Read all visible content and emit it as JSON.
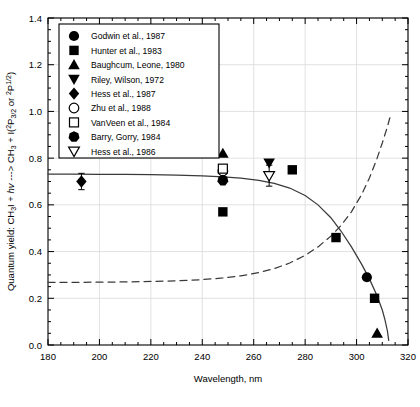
{
  "chart_data": {
    "type": "scatter",
    "title": "",
    "xlabel": "Wavelength, nm",
    "ylabel": "Quantum yield: CH3I + hv ---> CH3 + I(2P3/2 or 2P1/2)",
    "ylabel_parts": {
      "pre": "Quantum yield: CH",
      "sub1": "3",
      "mid1": "I + ",
      "italic1": "hv",
      "mid2": " ---> CH",
      "sub2": "3",
      "mid3": " + I(",
      "sup1": "2",
      "mid4": "P",
      "sub3": "3/2",
      "mid5": " or ",
      "sup2": "2",
      "mid6": "P",
      "sup3": "1/2",
      "post": ")"
    },
    "xlim": [
      180,
      320
    ],
    "ylim": [
      0.0,
      1.4
    ],
    "xticks": [
      180,
      200,
      220,
      240,
      260,
      280,
      300,
      320
    ],
    "yticks": [
      "0.0",
      "0.2",
      "0.4",
      "0.6",
      "0.8",
      "1.0",
      "1.2",
      "1.4"
    ],
    "ytick_values": [
      0.0,
      0.2,
      0.4,
      0.6,
      0.8,
      1.0,
      1.2,
      1.4
    ],
    "xminor_interval": 5,
    "yminor_interval": 0.05,
    "grid": true,
    "grid_color": "#d9d9d9",
    "legend_position": "upper-left",
    "series": [
      {
        "name": "Godwin et al., 1987",
        "marker": "filled-circle",
        "points": [
          {
            "x": 304,
            "y": 0.29
          }
        ]
      },
      {
        "name": "Hunter et al., 1983",
        "marker": "filled-square",
        "points": [
          {
            "x": 248,
            "y": 0.57
          },
          {
            "x": 275,
            "y": 0.75
          },
          {
            "x": 292,
            "y": 0.46
          },
          {
            "x": 307,
            "y": 0.2
          }
        ]
      },
      {
        "name": "Baughcum, Leone, 1980",
        "marker": "filled-up-triangle",
        "points": [
          {
            "x": 248,
            "y": 0.82
          },
          {
            "x": 308,
            "y": 0.05
          }
        ]
      },
      {
        "name": "Riley, Wilson, 1972",
        "marker": "filled-down-triangle",
        "points": [
          {
            "x": 266,
            "y": 0.78
          }
        ]
      },
      {
        "name": "Hess et al., 1987",
        "marker": "filled-diamond",
        "points": [
          {
            "x": 193,
            "y": 0.7,
            "yerr": 0.035
          }
        ]
      },
      {
        "name": "Zhu et al., 1988",
        "marker": "open-circle",
        "points": [
          {
            "x": 248,
            "y": 0.745
          }
        ]
      },
      {
        "name": "VanVeen et al., 1984",
        "marker": "open-square",
        "points": [
          {
            "x": 248,
            "y": 0.755
          }
        ]
      },
      {
        "name": "Barry, Gorry, 1984",
        "marker": "filled-heptagon",
        "points": [
          {
            "x": 248,
            "y": 0.705
          }
        ]
      },
      {
        "name": "Hess et al., 1986",
        "marker": "open-down-triangle",
        "points": [
          {
            "x": 266,
            "y": 0.725,
            "yerr": 0.045
          }
        ]
      }
    ],
    "curves": [
      {
        "name": "solid-curve",
        "style": "solid",
        "points": [
          {
            "x": 180,
            "y": 0.732
          },
          {
            "x": 190,
            "y": 0.732
          },
          {
            "x": 200,
            "y": 0.731
          },
          {
            "x": 210,
            "y": 0.73
          },
          {
            "x": 220,
            "y": 0.729
          },
          {
            "x": 230,
            "y": 0.727
          },
          {
            "x": 240,
            "y": 0.724
          },
          {
            "x": 248,
            "y": 0.72
          },
          {
            "x": 255,
            "y": 0.714
          },
          {
            "x": 262,
            "y": 0.705
          },
          {
            "x": 268,
            "y": 0.692
          },
          {
            "x": 274,
            "y": 0.672
          },
          {
            "x": 280,
            "y": 0.64
          },
          {
            "x": 285,
            "y": 0.6
          },
          {
            "x": 290,
            "y": 0.545
          },
          {
            "x": 294,
            "y": 0.487
          },
          {
            "x": 298,
            "y": 0.42
          },
          {
            "x": 302,
            "y": 0.345
          },
          {
            "x": 305,
            "y": 0.283
          },
          {
            "x": 308,
            "y": 0.21
          },
          {
            "x": 310,
            "y": 0.15
          },
          {
            "x": 311,
            "y": 0.11
          },
          {
            "x": 312,
            "y": 0.06
          },
          {
            "x": 312.5,
            "y": 0.02
          }
        ]
      },
      {
        "name": "dashed-curve",
        "style": "dashed",
        "points": [
          {
            "x": 180,
            "y": 0.268
          },
          {
            "x": 190,
            "y": 0.268
          },
          {
            "x": 200,
            "y": 0.269
          },
          {
            "x": 210,
            "y": 0.27
          },
          {
            "x": 220,
            "y": 0.272
          },
          {
            "x": 230,
            "y": 0.275
          },
          {
            "x": 240,
            "y": 0.28
          },
          {
            "x": 248,
            "y": 0.287
          },
          {
            "x": 255,
            "y": 0.296
          },
          {
            "x": 262,
            "y": 0.31
          },
          {
            "x": 268,
            "y": 0.327
          },
          {
            "x": 274,
            "y": 0.351
          },
          {
            "x": 280,
            "y": 0.384
          },
          {
            "x": 285,
            "y": 0.42
          },
          {
            "x": 290,
            "y": 0.466
          },
          {
            "x": 294,
            "y": 0.512
          },
          {
            "x": 298,
            "y": 0.57
          },
          {
            "x": 302,
            "y": 0.645
          },
          {
            "x": 305,
            "y": 0.715
          },
          {
            "x": 308,
            "y": 0.8
          },
          {
            "x": 310,
            "y": 0.865
          },
          {
            "x": 312,
            "y": 0.935
          },
          {
            "x": 313,
            "y": 0.975
          }
        ]
      }
    ]
  },
  "legend": {
    "entries": [
      {
        "label": "Godwin et al., 1987",
        "marker": "filled-circle"
      },
      {
        "label": "Hunter et al., 1983",
        "marker": "filled-square"
      },
      {
        "label": "Baughcum, Leone, 1980",
        "marker": "filled-up-triangle"
      },
      {
        "label": "Riley, Wilson, 1972",
        "marker": "filled-down-triangle"
      },
      {
        "label": "Hess et al., 1987",
        "marker": "filled-diamond"
      },
      {
        "label": "Zhu et al., 1988",
        "marker": "open-circle"
      },
      {
        "label": "VanVeen et al., 1984",
        "marker": "open-square"
      },
      {
        "label": "Barry, Gorry, 1984",
        "marker": "filled-heptagon"
      },
      {
        "label": "Hess et al., 1986",
        "marker": "open-down-triangle"
      }
    ]
  },
  "colors": {
    "foreground": "#000000",
    "background": "#ffffff",
    "grid": "#d9d9d9",
    "curve": "#3a3a3a"
  }
}
